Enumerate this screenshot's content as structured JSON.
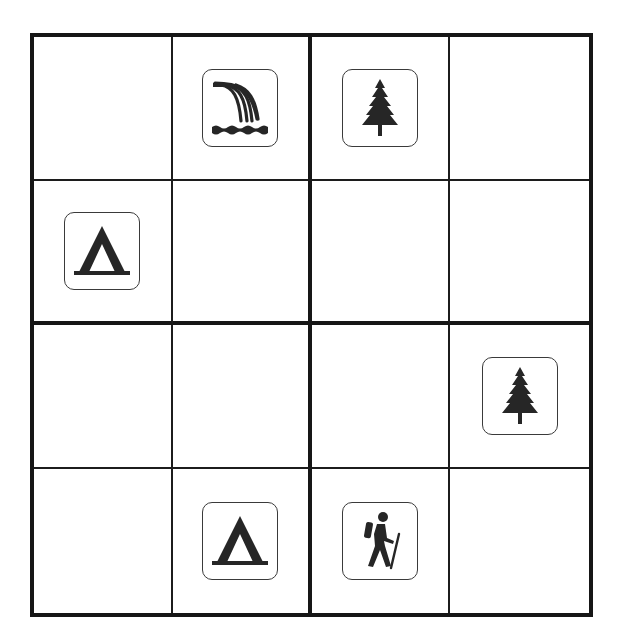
{
  "puzzle": {
    "type": "4x4 picture sudoku",
    "rows": 4,
    "cols": 4,
    "symbols": [
      "waterfall",
      "tree",
      "tent",
      "hiker"
    ],
    "colors": {
      "ink": "#262626",
      "border": "#161616",
      "background": "#ffffff"
    },
    "grid": [
      [
        "",
        "waterfall",
        "tree",
        ""
      ],
      [
        "tent",
        "",
        "",
        ""
      ],
      [
        "",
        "",
        "",
        "tree"
      ],
      [
        "",
        "tent",
        "hiker",
        ""
      ]
    ]
  }
}
